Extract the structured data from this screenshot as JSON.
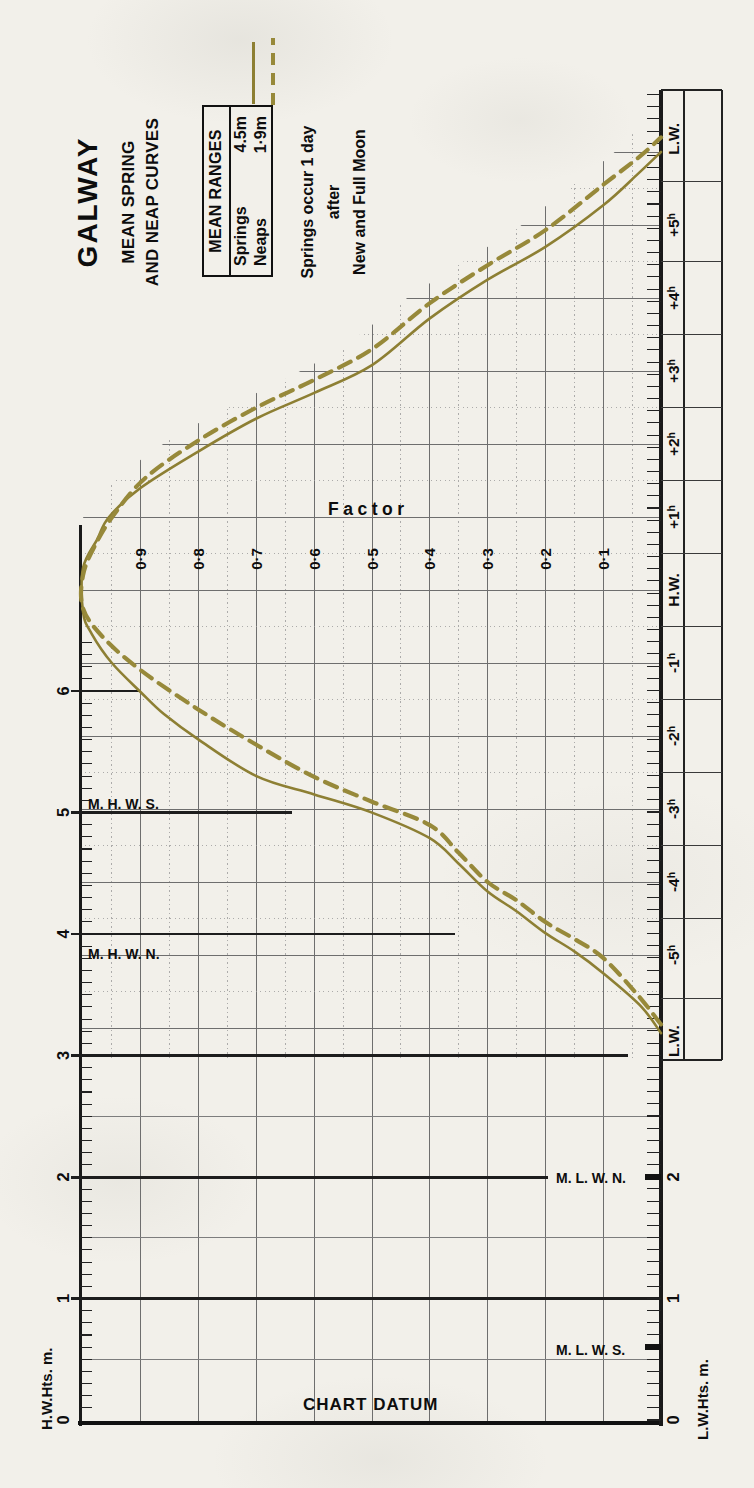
{
  "title": "GALWAY",
  "subtitle_lines": [
    "MEAN SPRING",
    "AND NEAP CURVES"
  ],
  "legend": {
    "title": "MEAN RANGES",
    "rows": [
      {
        "name": "Springs",
        "value": "4.5m"
      },
      {
        "name": "Neaps",
        "value": "1·9m"
      }
    ]
  },
  "note_lines": [
    "Springs occur 1 day",
    "after",
    "New and Full Moon"
  ],
  "chart_datum_label": "CHART DATUM",
  "hw_scale": {
    "label": "H.W.Hts. m.",
    "numbers": [
      "0",
      "1",
      "2",
      "3",
      "4",
      "5",
      "6"
    ]
  },
  "lw_scale": {
    "label": "L.W.Hts. m.",
    "numbers": [
      "0",
      "1",
      "2"
    ]
  },
  "marks": {
    "mhws": {
      "text": "M. H. W. S.",
      "height_m": 5.0
    },
    "mhwn": {
      "text": "M. H. W. N.",
      "height_m": 4.0
    },
    "mlwn": {
      "text": "M. L. W. N.",
      "height_m": 2.0
    },
    "mlws": {
      "text": "M. L. W. S.",
      "height_m": 0.6
    }
  },
  "colors": {
    "spring": "#8d7f33",
    "neap": "#97893a",
    "ink": "#0d0d0d",
    "grid": "#6e6e6e",
    "paper": "#f2f0ea"
  },
  "chart_data": {
    "type": "line",
    "ylabel": "Factor",
    "xlabel": "",
    "xlim": [
      -6.2,
      6.2
    ],
    "ylim": [
      0,
      1
    ],
    "factor_ticks": [
      {
        "v": 0.9,
        "label": "0·9"
      },
      {
        "v": 0.8,
        "label": "0·8"
      },
      {
        "v": 0.7,
        "label": "0·7"
      },
      {
        "v": 0.6,
        "label": "0·6"
      },
      {
        "v": 0.5,
        "label": "0·5"
      },
      {
        "v": 0.4,
        "label": "0·4"
      },
      {
        "v": 0.3,
        "label": "0·3"
      },
      {
        "v": 0.2,
        "label": "0·2"
      },
      {
        "v": 0.1,
        "label": "0·1"
      }
    ],
    "time_ticks": [
      {
        "t": -6.18,
        "text": "L.W."
      },
      {
        "t": -5,
        "text": "-5h"
      },
      {
        "t": -4,
        "text": "-4h"
      },
      {
        "t": -3,
        "text": "-3h"
      },
      {
        "t": -2,
        "text": "-2h"
      },
      {
        "t": -1,
        "text": "-1h"
      },
      {
        "t": 0,
        "text": "H.W."
      },
      {
        "t": 1,
        "text": "+1h"
      },
      {
        "t": 2,
        "text": "+2h"
      },
      {
        "t": 3,
        "text": "+3h"
      },
      {
        "t": 4,
        "text": "+4h"
      },
      {
        "t": 5,
        "text": "+5h"
      },
      {
        "t": 6.18,
        "text": "L.W."
      }
    ],
    "series": [
      {
        "name": "Springs (mean range 4.5m)",
        "style": "solid",
        "points": [
          [
            -6.07,
            0
          ],
          [
            -5.7,
            0.035
          ],
          [
            -5.25,
            0.1
          ],
          [
            -4.95,
            0.15
          ],
          [
            -4.7,
            0.2
          ],
          [
            -4.4,
            0.25
          ],
          [
            -4.13,
            0.3
          ],
          [
            -3.75,
            0.35
          ],
          [
            -3.4,
            0.4
          ],
          [
            -3.05,
            0.5
          ],
          [
            -2.8,
            0.6
          ],
          [
            -2.55,
            0.7
          ],
          [
            -2.05,
            0.8
          ],
          [
            -1.7,
            0.86
          ],
          [
            -1.4,
            0.9
          ],
          [
            -1.0,
            0.95
          ],
          [
            -0.6,
            0.985
          ],
          [
            -0.3,
            1
          ],
          [
            0.3,
            1
          ],
          [
            0.7,
            0.975
          ],
          [
            1.0,
            0.955
          ],
          [
            1.4,
            0.9
          ],
          [
            1.9,
            0.8
          ],
          [
            2.35,
            0.7
          ],
          [
            2.7,
            0.6
          ],
          [
            3.08,
            0.5
          ],
          [
            3.72,
            0.4
          ],
          [
            4.25,
            0.3
          ],
          [
            4.7,
            0.2
          ],
          [
            5.27,
            0.1
          ],
          [
            5.7,
            0.04
          ],
          [
            6.0,
            0
          ]
        ]
      },
      {
        "name": "Neaps (mean range 1·9m)",
        "style": "dashed",
        "points": [
          [
            -5.95,
            0
          ],
          [
            -5.55,
            0.04
          ],
          [
            -5.04,
            0.1
          ],
          [
            -4.78,
            0.15
          ],
          [
            -4.55,
            0.2
          ],
          [
            -4.25,
            0.25
          ],
          [
            -4.0,
            0.3
          ],
          [
            -3.6,
            0.35
          ],
          [
            -3.22,
            0.4
          ],
          [
            -2.9,
            0.5
          ],
          [
            -2.56,
            0.6
          ],
          [
            -2.12,
            0.7
          ],
          [
            -1.64,
            0.8
          ],
          [
            -1.1,
            0.9
          ],
          [
            -0.65,
            0.965
          ],
          [
            -0.25,
            1
          ],
          [
            0.2,
            1
          ],
          [
            0.6,
            0.98
          ],
          [
            1.05,
            0.945
          ],
          [
            1.55,
            0.89
          ],
          [
            2.05,
            0.8
          ],
          [
            2.5,
            0.7
          ],
          [
            2.88,
            0.6
          ],
          [
            3.3,
            0.5
          ],
          [
            3.93,
            0.4
          ],
          [
            4.45,
            0.3
          ],
          [
            4.93,
            0.2
          ],
          [
            5.55,
            0.1
          ],
          [
            5.95,
            0.035
          ],
          [
            6.2,
            0
          ]
        ]
      }
    ]
  }
}
